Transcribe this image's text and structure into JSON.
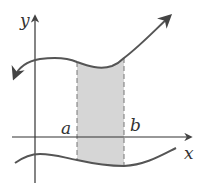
{
  "diagram": {
    "labels": {
      "y_axis": "y",
      "x_axis": "x",
      "a": "a",
      "b": "b"
    },
    "colors": {
      "curve": "#555555",
      "axis": "#333333",
      "shade": "#d6d6d6",
      "dash": "#777777"
    },
    "elements": [
      {
        "name": "x-axis",
        "type": "axis-arrow"
      },
      {
        "name": "y-axis",
        "type": "axis-arrow"
      },
      {
        "name": "upper-curve",
        "type": "curve",
        "ends": "arrows both ends"
      },
      {
        "name": "lower-curve",
        "type": "curve"
      },
      {
        "name": "shaded-region",
        "type": "region",
        "between": [
          "a",
          "b"
        ]
      },
      {
        "name": "line-x-equals-a",
        "type": "dashed-vertical"
      },
      {
        "name": "line-x-equals-b",
        "type": "dashed-vertical"
      }
    ]
  }
}
